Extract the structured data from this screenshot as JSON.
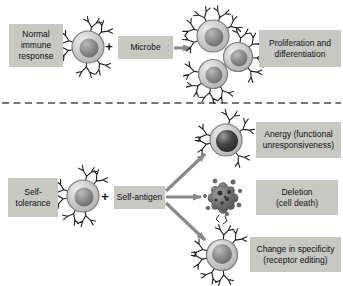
{
  "top_row": {
    "label": "Normal\nimmune\nresponse",
    "plus": "+",
    "stimulus": "Microbe",
    "outcome": "Proliferation and\ndifferentiation"
  },
  "bottom_row": {
    "label": "Self-\ntolerance",
    "plus": "+",
    "stimulus": "Self-antigen",
    "outcomes": {
      "anergy": "Anergy (functional\nunresponsiveness)",
      "deletion": "Deletion\n(cell death)",
      "editing": "Change in specificity\n(receptor editing)"
    }
  },
  "icons": {
    "lymphocyte": "lymphocyte-cell-icon",
    "proliferating_cluster": "proliferating-cell-cluster-icon",
    "anergic_cell": "anergic-lymphocyte-icon",
    "apoptotic_cell": "apoptotic-cell-icon",
    "edited_cell": "receptor-edited-lymphocyte-icon",
    "arrow": "arrow-icon",
    "divider": "dashed-divider"
  },
  "colors": {
    "background": "#ffffff",
    "label_box_bg": "#c7c8c2",
    "text": "#111111",
    "arrow": "#898989",
    "cell_outline": "#7d7d7d",
    "cell_fill": "#c9c9c9",
    "nucleus": "#8d8d8d",
    "nucleus_dark": "#2a2a2a",
    "receptor": "#1c1c1c",
    "dashed_line": "#4a4a4a"
  }
}
